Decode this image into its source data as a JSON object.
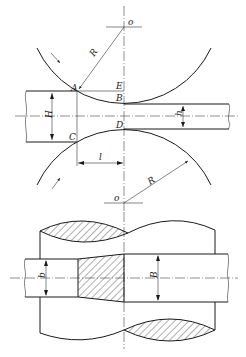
{
  "diagram": {
    "labels": {
      "center_top": "o",
      "center_bottom": "o",
      "radius_top": "R",
      "radius_bottom": "R",
      "point_a": "A",
      "point_b": "B",
      "point_c": "C",
      "point_d": "D",
      "point_e": "E",
      "entry_thickness": "H",
      "exit_thickness": "h",
      "contact_length": "l",
      "entry_width": "b",
      "exit_width": "B"
    },
    "views": [
      "side-view",
      "plan-view"
    ]
  }
}
